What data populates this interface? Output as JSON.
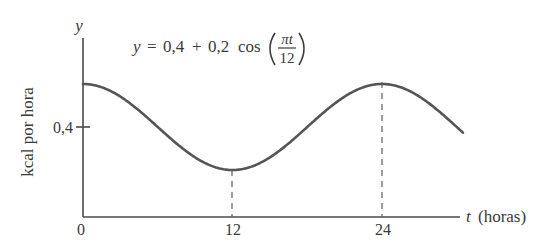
{
  "chart_data": {
    "type": "line",
    "equation": {
      "lhs": "y",
      "eq": "=",
      "constant": "0,4",
      "plus": "+",
      "amplitude": "0,2",
      "func": "cos",
      "numerator": "πt",
      "denominator": "12"
    },
    "xlabel": "t (horas)",
    "xlabel_var": "t",
    "xlabel_unit": "(horas)",
    "ylabel": "kcal por hora",
    "yaxis_var": "y",
    "x_ticks": [
      "0",
      "12",
      "24"
    ],
    "y_ticks": [
      "0,4"
    ],
    "xlim": [
      0,
      30
    ],
    "ylim": [
      0,
      0.7
    ],
    "grid": false,
    "legend": null,
    "annotations": [
      "dashed vertical line at t=12 (minimum)",
      "dashed vertical line at t=24 (maximum)"
    ],
    "series": [
      {
        "name": "y = 0.4 + 0.2 cos(πt/12)",
        "x": [
          0,
          3,
          6,
          9,
          12,
          15,
          18,
          21,
          24,
          27,
          30
        ],
        "values": [
          0.6,
          0.541,
          0.4,
          0.259,
          0.2,
          0.259,
          0.4,
          0.541,
          0.6,
          0.541,
          0.4
        ]
      }
    ],
    "t_end": 30.5
  },
  "colors": {
    "axis": "#4a4a4a",
    "curve": "#555555",
    "text": "#3a3a3a"
  }
}
